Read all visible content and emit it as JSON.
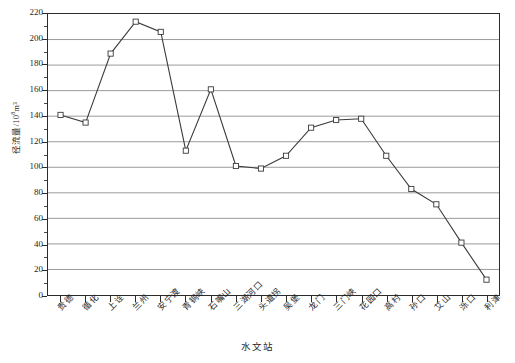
{
  "chart_data": {
    "type": "line",
    "title": "",
    "xlabel": "水文站",
    "ylabel": "径流量/10⁸m³",
    "ylabel_base": "径流量/10",
    "ylabel_exp": "8",
    "ylabel_unit": "m³",
    "ylim": [
      0,
      220
    ],
    "ytick_step": 20,
    "grid": true,
    "grid_axis": "y",
    "legend": "none",
    "marker": "open-square",
    "line_color": "#3a3a3a",
    "grid_color": "#9a9a9a",
    "axis_color": "#2b2b2b",
    "categories": [
      "贵德",
      "循化",
      "上诠",
      "兰州",
      "安宁渡",
      "青铜峡",
      "石嘴山",
      "三湖河口",
      "头道拐",
      "吴堡",
      "龙门",
      "三门峡",
      "花园口",
      "高村",
      "孙口",
      "艾山",
      "泺口",
      "利津"
    ],
    "values": [
      141,
      135,
      189,
      214,
      206,
      113,
      161,
      101,
      99,
      109,
      131,
      137,
      138,
      109,
      83,
      71,
      41,
      12
    ],
    "yticks": [
      0,
      20,
      40,
      60,
      80,
      100,
      120,
      140,
      160,
      180,
      200,
      220
    ]
  }
}
